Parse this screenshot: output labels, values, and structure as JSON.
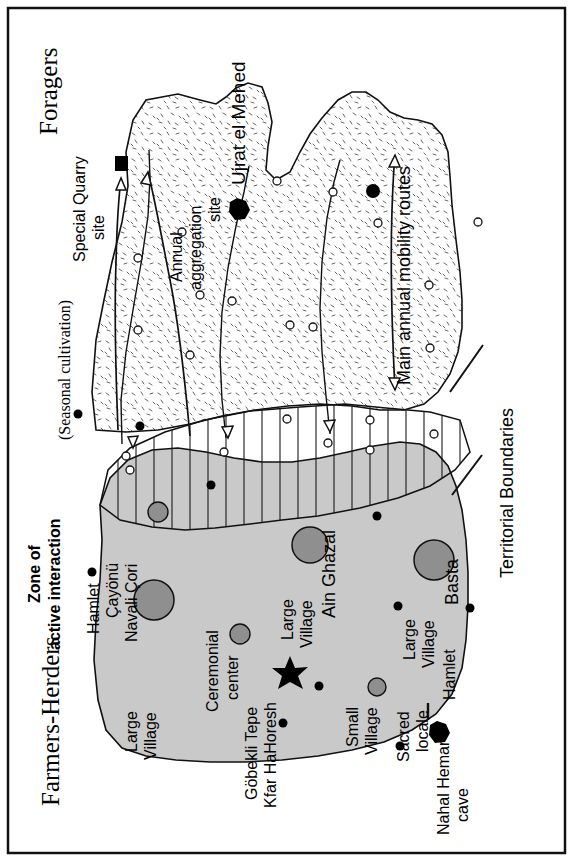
{
  "figure": {
    "orientation": "rotated-90-ccw",
    "frame_color": "#000000",
    "background": "#ffffff"
  },
  "regions": {
    "foragers": {
      "label": "Foragers",
      "fill": "#ffffff",
      "pattern": "stipple-dashes",
      "sublabel": "(Seasonal cultivation)"
    },
    "farmers": {
      "label": "Farmers-Herders",
      "fill": "#c9c9c9",
      "pattern": "solid-gray"
    },
    "interaction": {
      "label_line1": "Zone of",
      "label_line2": "active interaction",
      "fill": "#ffffff",
      "pattern": "vertical-hatch"
    }
  },
  "annotations": {
    "territorial_boundaries": "Territorial  Boundaries",
    "mobility_routes": "Main annual mobility routes",
    "special_quarry_line1": "Special Quarry",
    "special_quarry_line2": "site",
    "annual_aggregation_line1": "Annual",
    "annual_aggregation_line2": "aggregation",
    "annual_aggregation_line3": "site"
  },
  "sites": [
    {
      "name": "Ujrat el Mehed",
      "type": "annual-aggregation-site",
      "marker": "black-hexagon"
    },
    {
      "name": "Çayönü",
      "type": "large-village",
      "marker": "gray-circle-medium"
    },
    {
      "name": "Navali Çori",
      "type": "large-village",
      "marker": "gray-circle-large"
    },
    {
      "name": "Göbekli Tepe",
      "type": "ceremonial-center",
      "marker": "black-star"
    },
    {
      "name": "Kfar HaHoresh",
      "type": "ceremonial-center",
      "marker": "black-star"
    },
    {
      "name": "Ain Ghazal",
      "type": "large-village",
      "marker": "gray-circle-large"
    },
    {
      "name": "Basta",
      "type": "large-village",
      "marker": "gray-circle-large"
    },
    {
      "name": "Nahal Hemar",
      "type": "sacred-locale",
      "marker": "black-heptagon"
    },
    {
      "name": "cave",
      "type": "sacred-locale-cont",
      "marker": "none"
    }
  ],
  "legend_terms": {
    "hamlet_left": "Hamlet",
    "hamlet_right": "Hamlet",
    "large_village_1": "Large",
    "large_village_1b": "Village",
    "large_village_2": "Large",
    "large_village_2b": "Village",
    "large_village_3": "Large",
    "large_village_3b": "Village",
    "small_village": "Small",
    "small_village_b": "Village",
    "ceremonial_center": "Ceremonial",
    "ceremonial_center_b": "center",
    "sacred_locale": "Sacred",
    "sacred_locale_b": "locale",
    "nahal_hemar": "Nahal Hemar",
    "nahal_hemar_b": "cave",
    "gobekli": "Göbekli Tepe",
    "kfar": "Kfar HaHoresh",
    "cayonu": "Çayönü",
    "navali": "Navali Çori",
    "ain_ghazal": "Ain Ghazal",
    "basta": "Basta",
    "ujrat": "Ujrat el Mehed"
  },
  "colors": {
    "farmers_fill": "#c9c9c9",
    "village_fill": "#8f8f8f",
    "marker_black": "#000000",
    "line": "#1a1a1a"
  }
}
